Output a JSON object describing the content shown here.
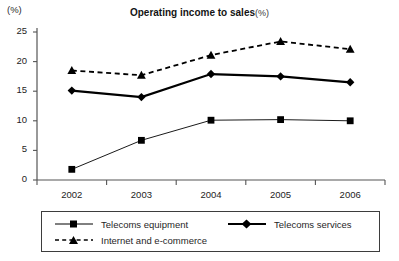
{
  "axis_unit_label": "(%)",
  "title": {
    "main": "Operating income to sales",
    "unit": "(%)"
  },
  "legend": {
    "equipment_label": "Telecoms equipment",
    "services_label": "Telecoms  services",
    "internet_label": "Internet and e-commerce"
  },
  "chart_data": {
    "type": "line",
    "xlabel": "",
    "ylabel": "(%)",
    "ylim": [
      0,
      25
    ],
    "yticks": [
      0,
      5,
      10,
      15,
      20,
      25
    ],
    "grid": false,
    "legend_position": "bottom",
    "categories": [
      "2002",
      "2003",
      "2004",
      "2005",
      "2006"
    ],
    "series": [
      {
        "name": "Telecoms equipment",
        "marker": "square",
        "line": "solid-thin",
        "color": "#000000",
        "values": [
          1.8,
          6.7,
          10.1,
          10.2,
          10.0
        ]
      },
      {
        "name": "Telecoms  services",
        "marker": "diamond",
        "line": "solid-thick",
        "color": "#000000",
        "values": [
          15.1,
          14.0,
          17.9,
          17.5,
          16.5
        ]
      },
      {
        "name": "Internet and e-commerce",
        "marker": "triangle",
        "line": "dashed",
        "color": "#000000",
        "values": [
          18.5,
          17.7,
          21.1,
          23.4,
          22.1
        ]
      }
    ]
  }
}
